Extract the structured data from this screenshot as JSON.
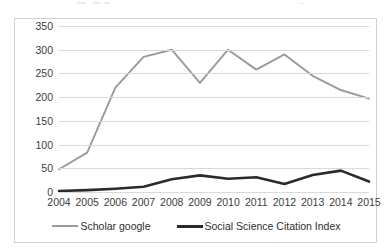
{
  "chart_data": {
    "type": "line",
    "title": "",
    "subtitle": "",
    "xlabel": "",
    "ylabel": "",
    "categories": [
      "2004",
      "2005",
      "2006",
      "2007",
      "2008",
      "2009",
      "2010",
      "2011",
      "2012",
      "2013",
      "2014",
      "2015"
    ],
    "series": [
      {
        "name": "Scholar google",
        "color": "#9a9a9a",
        "values": [
          48,
          83,
          220,
          285,
          300,
          230,
          300,
          258,
          290,
          245,
          215,
          197
        ]
      },
      {
        "name": "Social Science Citation Index",
        "color": "#2b2b2b",
        "values": [
          2,
          4,
          7,
          11,
          27,
          35,
          28,
          31,
          17,
          36,
          45,
          22
        ]
      }
    ],
    "ylim": [
      0,
      350
    ],
    "yticks": [
      "0",
      "50",
      "100",
      "150",
      "200",
      "250",
      "300",
      "350"
    ],
    "ytick_values": [
      0,
      50,
      100,
      150,
      200,
      250,
      300,
      350
    ],
    "grid": true,
    "grid_axis": "y",
    "legend_position": "bottom"
  },
  "legend": {
    "items": [
      {
        "label": "Scholar google",
        "swatch": "gray"
      },
      {
        "label": "Social Science Citation Index",
        "swatch": "dark"
      }
    ]
  }
}
